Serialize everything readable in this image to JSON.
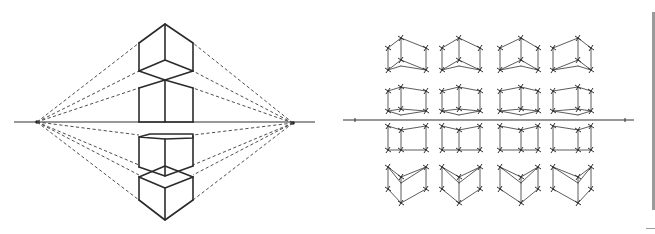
{
  "figure": {
    "colors": {
      "line": "#2b2b2b",
      "background": "#ffffff",
      "scrollbar": "#9a9a9a"
    }
  },
  "left_panel": {
    "horizon": {
      "y": 122,
      "x1": 14,
      "x2": 315
    },
    "vanishing_points": [
      {
        "name": "VP-left",
        "x": 37,
        "y": 122
      },
      {
        "name": "VP-right",
        "x": 293,
        "y": 123
      }
    ],
    "cubes": [
      {
        "name": "cube-above-horizon",
        "position": "above"
      },
      {
        "name": "cube-touching-horizon",
        "position": "on-horizon"
      },
      {
        "name": "cube-below-horizon",
        "position": "below"
      },
      {
        "name": "cube-far-below-horizon",
        "position": "far-below"
      }
    ]
  },
  "right_panel": {
    "horizon": {
      "y": 120,
      "x1": 343,
      "x2": 634
    },
    "grid": {
      "rows": 4,
      "cols": 4,
      "count": 16
    }
  }
}
